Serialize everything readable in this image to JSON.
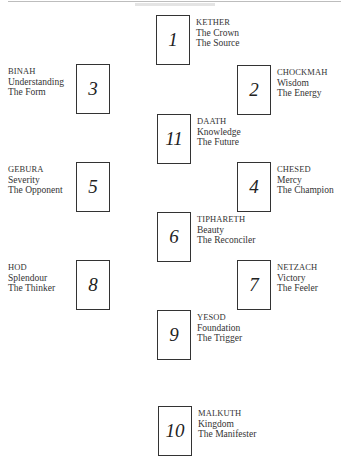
{
  "diagram": {
    "type": "tree-of-life",
    "nodes": [
      {
        "number": "1",
        "name": "KETHER",
        "meaning": "The Crown",
        "role": "The Source",
        "box": [
          156,
          15
        ],
        "label_side": "right"
      },
      {
        "number": "2",
        "name": "CHOCKMAH",
        "meaning": "Wisdom",
        "role": "The Energy",
        "box": [
          237,
          65
        ],
        "label_side": "right"
      },
      {
        "number": "3",
        "name": "BINAH",
        "meaning": "Understanding",
        "role": "The Form",
        "box": [
          76,
          64
        ],
        "label_side": "left"
      },
      {
        "number": "11",
        "name": "DAATH",
        "meaning": "Knowledge",
        "role": "The Future",
        "box": [
          157,
          114
        ],
        "label_side": "right"
      },
      {
        "number": "4",
        "name": "CHESED",
        "meaning": "Mercy",
        "role": "The Champion",
        "box": [
          237,
          162
        ],
        "label_side": "right"
      },
      {
        "number": "5",
        "name": "GEBURA",
        "meaning": "Severity",
        "role": "The Opponent",
        "box": [
          76,
          162
        ],
        "label_side": "left"
      },
      {
        "number": "6",
        "name": "TIPHARETH",
        "meaning": "Beauty",
        "role": "The Reconciler",
        "box": [
          157,
          212
        ],
        "label_side": "right"
      },
      {
        "number": "7",
        "name": "NETZACH",
        "meaning": "Victory",
        "role": "The Feeler",
        "box": [
          237,
          260
        ],
        "label_side": "right"
      },
      {
        "number": "8",
        "name": "HOD",
        "meaning": "Splendour",
        "role": "The Thinker",
        "box": [
          76,
          260
        ],
        "label_side": "left"
      },
      {
        "number": "9",
        "name": "YESOD",
        "meaning": "Foundation",
        "role": "The Trigger",
        "box": [
          157,
          310
        ],
        "label_side": "right"
      },
      {
        "number": "10",
        "name": "MALKUTH",
        "meaning": "Kingdom",
        "role": "The Manifester",
        "box": [
          158,
          406
        ],
        "label_side": "right"
      }
    ]
  }
}
